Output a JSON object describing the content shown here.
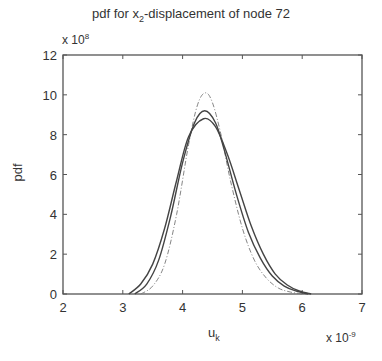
{
  "chart_data": {
    "type": "line",
    "title": "pdf for x2-displacement of node 72",
    "title_main": "pdf for x",
    "title_sub": "2",
    "title_rest": "-displacement of node 72",
    "xlabel": "u",
    "xlabel_sub": "k",
    "ylabel": "pdf",
    "x_multiplier": "x 10",
    "x_exponent": "-9",
    "y_multiplier": "x 10",
    "y_exponent": "8",
    "xlim": [
      2,
      7
    ],
    "ylim": [
      0,
      12
    ],
    "xticks": [
      "2",
      "3",
      "4",
      "5",
      "6",
      "7"
    ],
    "yticks": [
      "0",
      "2",
      "4",
      "6",
      "8",
      "10",
      "12"
    ],
    "grid": false,
    "legend": null,
    "series": [
      {
        "name": "curve-dashdot",
        "style": "dash-dot thin",
        "x": [
          3.3,
          3.5,
          3.7,
          3.9,
          4.1,
          4.25,
          4.38,
          4.5,
          4.65,
          4.8,
          5.0,
          5.2,
          5.4,
          5.6,
          5.8,
          6.0
        ],
        "y": [
          0.0,
          0.4,
          1.5,
          4.0,
          7.5,
          9.5,
          10.1,
          9.6,
          7.9,
          5.7,
          3.3,
          1.7,
          0.8,
          0.3,
          0.1,
          0.0
        ]
      },
      {
        "name": "curve-solid-1",
        "style": "solid",
        "x": [
          3.2,
          3.4,
          3.6,
          3.8,
          4.0,
          4.2,
          4.37,
          4.55,
          4.7,
          4.9,
          5.1,
          5.3,
          5.5,
          5.7,
          5.9,
          6.1
        ],
        "y": [
          0.0,
          0.5,
          1.7,
          3.9,
          6.6,
          8.6,
          9.2,
          8.6,
          7.2,
          5.0,
          3.1,
          1.8,
          0.9,
          0.4,
          0.15,
          0.0
        ]
      },
      {
        "name": "curve-solid-2",
        "style": "solid",
        "x": [
          3.1,
          3.3,
          3.5,
          3.7,
          3.9,
          4.1,
          4.35,
          4.55,
          4.75,
          4.95,
          5.15,
          5.35,
          5.55,
          5.75,
          5.95,
          6.15
        ],
        "y": [
          0.0,
          0.5,
          1.5,
          3.3,
          5.7,
          7.9,
          8.8,
          8.4,
          7.0,
          5.2,
          3.4,
          2.0,
          1.0,
          0.45,
          0.15,
          0.0
        ]
      }
    ]
  }
}
